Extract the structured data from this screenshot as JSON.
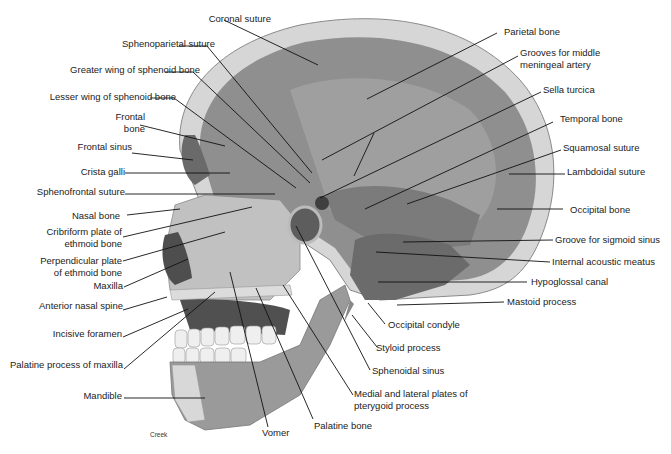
{
  "figure": {
    "credit": "Creek",
    "colors": {
      "background": "#ffffff",
      "bone_outer": "#d8d8d8",
      "cranial_cavity": "#8e8e8e",
      "cavity_light": "#a6a6a6",
      "face_bone": "#bdbdbd",
      "dark_cavity": "#555555",
      "teeth": "#eeeeee",
      "leader_line": "#111111",
      "text": "#222222"
    }
  },
  "labels_left": [
    {
      "id": "coronal-suture",
      "text": "Coronal suture",
      "x": 116,
      "y": 13,
      "w": 155,
      "align": "right",
      "line": [
        [
          224,
          20
        ],
        [
          318,
          65
        ]
      ]
    },
    {
      "id": "sphenoparietal-suture",
      "text": "Sphenoparietal suture",
      "x": 60,
      "y": 38,
      "w": 155,
      "align": "right",
      "line": [
        [
          179,
          46
        ],
        [
          207,
          46
        ],
        [
          312,
          173
        ]
      ]
    },
    {
      "id": "greater-wing-sphenoid",
      "text": "Greater wing of sphenoid bone",
      "x": 10,
      "y": 64,
      "w": 190,
      "align": "right",
      "line": [
        [
          165,
          72
        ],
        [
          193,
          72
        ],
        [
          310,
          183
        ]
      ]
    },
    {
      "id": "lesser-wing-sphenoid",
      "text": "Lesser wing of sphenoid bone",
      "x": 4,
      "y": 91,
      "w": 172,
      "align": "right",
      "line": [
        [
          150,
          98
        ],
        [
          174,
          98
        ],
        [
          296,
          188
        ]
      ]
    },
    {
      "id": "frontal-bone",
      "text": "Frontal\nbone",
      "x": 85,
      "y": 111,
      "w": 60,
      "align": "right",
      "line": [
        [
          140,
          125
        ],
        [
          225,
          146
        ]
      ]
    },
    {
      "id": "frontal-sinus",
      "text": "Frontal sinus",
      "x": 60,
      "y": 141,
      "w": 72,
      "align": "right",
      "line": [
        [
          132,
          153
        ],
        [
          193,
          160
        ]
      ]
    },
    {
      "id": "crista-galli",
      "text": "Crista galli",
      "x": 60,
      "y": 166,
      "w": 65,
      "align": "right",
      "line": [
        [
          125,
          173
        ],
        [
          230,
          173
        ]
      ]
    },
    {
      "id": "sphenofrontal-suture",
      "text": "Sphenofrontal suture",
      "x": 20,
      "y": 186,
      "w": 105,
      "align": "right",
      "line": [
        [
          125,
          194
        ],
        [
          275,
          194
        ]
      ]
    },
    {
      "id": "nasal-bone",
      "text": "Nasal bone",
      "x": 60,
      "y": 210,
      "w": 60,
      "align": "right",
      "line": [
        [
          127,
          215
        ],
        [
          180,
          209
        ]
      ]
    },
    {
      "id": "cribriform-plate",
      "text": "Cribriform plate of\nethmoid bone",
      "x": 30,
      "y": 226,
      "w": 92,
      "align": "right",
      "line": [
        [
          123,
          237
        ],
        [
          252,
          207
        ]
      ]
    },
    {
      "id": "perpendicular-plate",
      "text": "Perpendicular plate\nof ethmoid bone",
      "x": 30,
      "y": 255,
      "w": 92,
      "align": "right",
      "line": [
        [
          123,
          261
        ],
        [
          225,
          232
        ]
      ]
    },
    {
      "id": "maxilla",
      "text": "Maxilla",
      "x": 60,
      "y": 280,
      "w": 63,
      "align": "right",
      "line": [
        [
          124,
          287
        ],
        [
          188,
          259
        ]
      ]
    },
    {
      "id": "anterior-nasal-spine",
      "text": "Anterior nasal spine",
      "x": 20,
      "y": 300,
      "w": 103,
      "align": "right",
      "line": [
        [
          123,
          310
        ],
        [
          167,
          297
        ]
      ]
    },
    {
      "id": "incisive-foramen",
      "text": "Incisive foramen",
      "x": 30,
      "y": 328,
      "w": 92,
      "align": "right",
      "line": [
        [
          123,
          337
        ],
        [
          188,
          309
        ]
      ]
    },
    {
      "id": "palatine-process-maxilla",
      "text": "Palatine process of maxilla",
      "x": 0,
      "y": 359,
      "w": 123,
      "align": "right",
      "line": [
        [
          124,
          369
        ],
        [
          215,
          292
        ]
      ]
    },
    {
      "id": "mandible",
      "text": "Mandible",
      "x": 60,
      "y": 390,
      "w": 62,
      "align": "right",
      "line": [
        [
          124,
          398
        ],
        [
          205,
          398
        ]
      ]
    }
  ],
  "labels_right": [
    {
      "id": "parietal-bone",
      "text": "Parietal bone",
      "x": 504,
      "y": 26,
      "align": "left",
      "line": [
        [
          497,
          33
        ],
        [
          367,
          99
        ]
      ]
    },
    {
      "id": "grooves-middle-meningeal",
      "text": "Grooves for middle\nmeningeal artery",
      "x": 520,
      "y": 47,
      "align": "left",
      "line": [
        [
          518,
          56
        ],
        [
          322,
          160
        ]
      ],
      "branch": [
        [
          374,
          133
        ],
        [
          354,
          176
        ]
      ]
    },
    {
      "id": "sella-turcica",
      "text": "Sella turcica",
      "x": 543,
      "y": 84,
      "align": "left",
      "line": [
        [
          541,
          92
        ],
        [
          320,
          198
        ]
      ]
    },
    {
      "id": "temporal-bone",
      "text": "Temporal bone",
      "x": 560,
      "y": 113,
      "align": "left",
      "line": [
        [
          553,
          122
        ],
        [
          365,
          209
        ]
      ]
    },
    {
      "id": "squamosal-suture",
      "text": "Squamosal suture",
      "x": 563,
      "y": 142,
      "align": "left",
      "line": [
        [
          561,
          150
        ],
        [
          407,
          204
        ]
      ]
    },
    {
      "id": "lambdoidal-suture",
      "text": "Lambdoidal suture",
      "x": 567,
      "y": 166,
      "align": "left",
      "line": [
        [
          565,
          174
        ],
        [
          509,
          174
        ]
      ]
    },
    {
      "id": "occipital-bone",
      "text": "Occipital bone",
      "x": 570,
      "y": 204,
      "align": "left",
      "line": [
        [
          563,
          209
        ],
        [
          497,
          209
        ]
      ]
    },
    {
      "id": "groove-sigmoid-sinus",
      "text": "Groove for sigmoid sinus",
      "x": 555,
      "y": 234,
      "align": "left",
      "line": [
        [
          553,
          240
        ],
        [
          403,
          242
        ]
      ]
    },
    {
      "id": "internal-acoustic-meatus",
      "text": "Internal acoustic meatus",
      "x": 552,
      "y": 256,
      "align": "left",
      "line": [
        [
          550,
          262
        ],
        [
          376,
          252
        ]
      ]
    },
    {
      "id": "hypoglossal-canal",
      "text": "Hypoglossal canal",
      "x": 531,
      "y": 276,
      "align": "left",
      "line": [
        [
          527,
          282
        ],
        [
          378,
          282
        ]
      ]
    },
    {
      "id": "mastoid-process",
      "text": "Mastoid process",
      "x": 507,
      "y": 296,
      "align": "left",
      "line": [
        [
          504,
          302
        ],
        [
          397,
          305
        ]
      ]
    },
    {
      "id": "occipital-condyle",
      "text": "Occipital condyle",
      "x": 388,
      "y": 319,
      "align": "left",
      "line": [
        [
          385,
          324
        ],
        [
          368,
          303
        ]
      ]
    },
    {
      "id": "styloid-process",
      "text": "Styloid process",
      "x": 376,
      "y": 342,
      "align": "left",
      "line": [
        [
          377,
          347
        ],
        [
          352,
          315
        ]
      ]
    },
    {
      "id": "sphenoidal-sinus",
      "text": "Sphenoidal sinus",
      "x": 372,
      "y": 365,
      "align": "left",
      "line": [
        [
          370,
          370
        ],
        [
          296,
          226
        ]
      ]
    },
    {
      "id": "pterygoid-plates",
      "text": "Medial and lateral plates of\npterygoid process",
      "x": 354,
      "y": 388,
      "align": "left",
      "line": [
        [
          353,
          395
        ],
        [
          283,
          285
        ]
      ]
    },
    {
      "id": "palatine-bone",
      "text": "Palatine bone",
      "x": 314,
      "y": 420,
      "align": "left",
      "line": [
        [
          313,
          419
        ],
        [
          256,
          288
        ]
      ]
    },
    {
      "id": "vomer",
      "text": "Vomer",
      "x": 262,
      "y": 427,
      "align": "left",
      "line": [
        [
          268,
          427
        ],
        [
          230,
          272
        ]
      ]
    }
  ]
}
